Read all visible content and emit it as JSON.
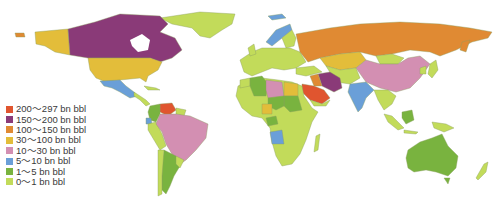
{
  "map": {
    "title": "",
    "type": "choropleth-world",
    "subject": "Proven oil reserves by country",
    "unit": "bn bbl"
  },
  "legend": {
    "items": [
      {
        "label": "200～297 bn bbl",
        "color": "#e0552f"
      },
      {
        "label": "150～200 bn bbl",
        "color": "#8a3a78"
      },
      {
        "label": "100～150 bn bbl",
        "color": "#e08a33"
      },
      {
        "label": "30～100 bn bbl",
        "color": "#e3bd3a"
      },
      {
        "label": "10～30 bn bbl",
        "color": "#d38fb2"
      },
      {
        "label": "5～10 bn bbl",
        "color": "#6a9fd8"
      },
      {
        "label": "1～5 bn bbl",
        "color": "#79b33f"
      },
      {
        "label": "0～1 bn bbl",
        "color": "#c2db5a"
      }
    ]
  },
  "regions": {
    "canada": "#8a3a78",
    "usa": "#e3bd3a",
    "alaska": "#e3bd3a",
    "mexico": "#6a9fd8",
    "greenland": "#c2db5a",
    "venezuela": "#e0552f",
    "brazil": "#d38fb2",
    "argentina": "#79b33f",
    "russia": "#e08a33",
    "kazakhstan": "#e3bd3a",
    "china": "#d38fb2",
    "iran": "#8a3a78",
    "saudi_arabia": "#e0552f",
    "india": "#6a9fd8",
    "libya": "#d38fb2",
    "nigeria": "#e3bd3a",
    "algeria": "#79b33f",
    "angola": "#6a9fd8",
    "australia": "#79b33f",
    "europe": "#c2db5a",
    "africa": "#c2db5a"
  }
}
